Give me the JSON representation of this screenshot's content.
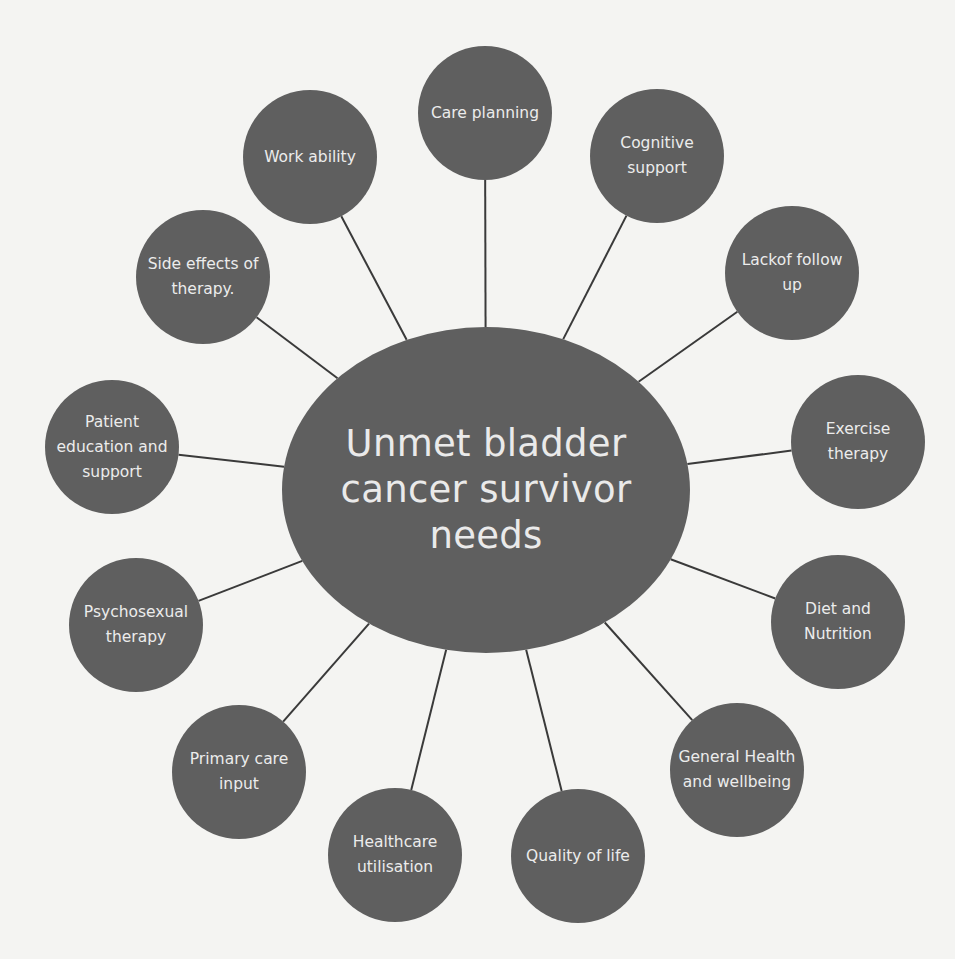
{
  "diagram": {
    "type": "hub-and-spoke",
    "colors": {
      "background": "#f4f4f2",
      "node_fill": "#5f5f5f",
      "node_text": "#ececec",
      "connector": "#3a3a3a"
    },
    "hub": {
      "label": "Unmet bladder cancer survivor needs",
      "cx": 486,
      "cy": 490,
      "rx": 204,
      "ry": 163
    },
    "nodes": [
      {
        "label": "Care planning",
        "cx": 485,
        "cy": 113
      },
      {
        "label": "Cognitive support",
        "cx": 657,
        "cy": 156
      },
      {
        "label": "Lackof follow up",
        "cx": 792,
        "cy": 273
      },
      {
        "label": "Exercise therapy",
        "cx": 858,
        "cy": 442
      },
      {
        "label": "Diet and Nutrition",
        "cx": 838,
        "cy": 622
      },
      {
        "label": "General Health and wellbeing",
        "cx": 737,
        "cy": 770
      },
      {
        "label": "Quality of life",
        "cx": 578,
        "cy": 856
      },
      {
        "label": "Healthcare utilisation",
        "cx": 395,
        "cy": 855
      },
      {
        "label": "Primary care input",
        "cx": 239,
        "cy": 772
      },
      {
        "label": "Psychosexual therapy",
        "cx": 136,
        "cy": 625
      },
      {
        "label": "Patient education and support",
        "cx": 112,
        "cy": 447
      },
      {
        "label": "Side effects of therapy.",
        "cx": 203,
        "cy": 277
      },
      {
        "label": "Work ability",
        "cx": 310,
        "cy": 157
      }
    ],
    "node_radius": 67
  }
}
